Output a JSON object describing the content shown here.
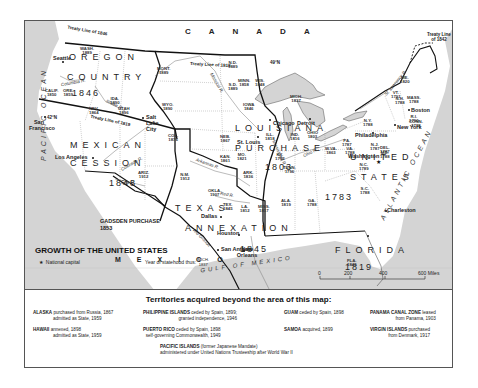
{
  "map": {
    "title": "GROWTH OF THE UNITED STATES",
    "legend": {
      "capital_symbol": "★",
      "capital_label": "National capital",
      "statehood_label": "Year of statehood thus:",
      "statehood_example_state": "MICH.",
      "statehood_example_year": "1837"
    },
    "countries": {
      "canada": "CANADA",
      "mexico": "MEXICO"
    },
    "oceans": {
      "pacific": "PACIFIC OCEAN",
      "atlantic": "ATLANTIC OCEAN",
      "gulf": "GULF OF MEXICO"
    },
    "regions": [
      {
        "name": "OREGON",
        "year": ""
      },
      {
        "name": "COUNTRY",
        "year": "1846"
      },
      {
        "name": "LOUISIANA",
        "year": ""
      },
      {
        "name": "PURCHASE",
        "year": "1803"
      },
      {
        "name": "MEXICAN",
        "year": ""
      },
      {
        "name": "CESSION",
        "year": "1848"
      },
      {
        "name": "TEXAS",
        "year": ""
      },
      {
        "name": "ANNEXATION",
        "year": "1845"
      },
      {
        "name": "UNITED",
        "year": ""
      },
      {
        "name": "STATES",
        "year": "1783"
      },
      {
        "name": "FLORIDA",
        "year": "1819"
      },
      {
        "name": "GADSDEN PURCHASE",
        "year": "1853"
      }
    ],
    "treaty_lines": [
      "Treaty Line of 1846",
      "Treaty Line of 1818",
      "Treaty Line of 1819",
      "Treaty Line of 1842",
      "Treaty 1819",
      "49°N",
      "42°N"
    ],
    "rivers": [
      "Columbia R.",
      "Snake R.",
      "Missouri R.",
      "Colorado R.",
      "Gila R.",
      "Arkansas R.",
      "Red R.",
      "Rio Grande",
      "Mississippi R.",
      "Ohio R.",
      "St. Lawrence R.",
      "Sabine R."
    ],
    "cities": [
      "Seattle",
      "San Francisco",
      "Los Angeles",
      "Salt Lake City",
      "St. Louis",
      "Chicago",
      "Detroit",
      "Philadelphia",
      "New York",
      "Boston",
      "Washington",
      "Charleston",
      "New Orleans",
      "Dallas",
      "Houston",
      "San Antonio"
    ],
    "states": [
      {
        "abbr": "WASH.",
        "year": "1889"
      },
      {
        "abbr": "ORE.",
        "year": "1859"
      },
      {
        "abbr": "IDA.",
        "year": "1890"
      },
      {
        "abbr": "MONT.",
        "year": "1889"
      },
      {
        "abbr": "WYO.",
        "year": "1890"
      },
      {
        "abbr": "N.D.",
        "year": "1889"
      },
      {
        "abbr": "S.D.",
        "year": "1889"
      },
      {
        "abbr": "NEB.",
        "year": "1867"
      },
      {
        "abbr": "KAN.",
        "year": "1861"
      },
      {
        "abbr": "MINN.",
        "year": "1858"
      },
      {
        "abbr": "IOWA",
        "year": "1846"
      },
      {
        "abbr": "MO.",
        "year": "1821"
      },
      {
        "abbr": "WIS.",
        "year": "1848"
      },
      {
        "abbr": "ILL.",
        "year": "1818"
      },
      {
        "abbr": "MICH.",
        "year": "1837"
      },
      {
        "abbr": "IND.",
        "year": "1816"
      },
      {
        "abbr": "OHIO",
        "year": "1803"
      },
      {
        "abbr": "CALIF.",
        "year": "1850"
      },
      {
        "abbr": "NEV.",
        "year": "1864"
      },
      {
        "abbr": "UTAH",
        "year": "1896"
      },
      {
        "abbr": "COL.",
        "year": "1876"
      },
      {
        "abbr": "ARIZ.",
        "year": "1912"
      },
      {
        "abbr": "N.M.",
        "year": "1912"
      },
      {
        "abbr": "OKLA.",
        "year": "1907"
      },
      {
        "abbr": "TEX.",
        "year": "1845"
      },
      {
        "abbr": "ARK.",
        "year": "1836"
      },
      {
        "abbr": "LA.",
        "year": "1812"
      },
      {
        "abbr": "MISS.",
        "year": "1817"
      },
      {
        "abbr": "ALA.",
        "year": "1819"
      },
      {
        "abbr": "GA.",
        "year": "1788"
      },
      {
        "abbr": "FLA.",
        "year": "1845"
      },
      {
        "abbr": "TENN.",
        "year": "1796"
      },
      {
        "abbr": "KY.",
        "year": "1792"
      },
      {
        "abbr": "W.VA.",
        "year": "1863"
      },
      {
        "abbr": "VA.",
        "year": "1788"
      },
      {
        "abbr": "N.C.",
        "year": "1789"
      },
      {
        "abbr": "S.C.",
        "year": "1788"
      },
      {
        "abbr": "PA.",
        "year": "1787"
      },
      {
        "abbr": "N.Y.",
        "year": "1788"
      },
      {
        "abbr": "N.J.",
        "year": "1787"
      },
      {
        "abbr": "DEL.",
        "year": "1787"
      },
      {
        "abbr": "MD.",
        "year": "1788"
      },
      {
        "abbr": "VT.",
        "year": "1791"
      },
      {
        "abbr": "N.H.",
        "year": "1788"
      },
      {
        "abbr": "ME.",
        "year": "1820"
      },
      {
        "abbr": "MASS.",
        "year": "1788"
      },
      {
        "abbr": "R.I.",
        "year": "1790"
      },
      {
        "abbr": "CONN.",
        "year": "1788"
      }
    ],
    "scale": {
      "ticks": [
        "0",
        "200",
        "400",
        "600 Miles"
      ]
    }
  },
  "footer": {
    "title": "Territories acquired beyond the area of this map:",
    "items": [
      {
        "name": "ALASKA",
        "line1": "purchased from Russia, 1867",
        "line2": "admitted as State, 1959"
      },
      {
        "name": "HAWAII",
        "line1": "annexed, 1898",
        "line2": "admitted as State, 1959"
      },
      {
        "name": "PHILIPPINE ISLANDS",
        "line1": "ceded by Spain, 1899;",
        "line2": "granted independence, 1946"
      },
      {
        "name": "PUERTO RICO",
        "line1": "ceded by Spain, 1898",
        "line2": "self-governing Commonwealth, 1949"
      },
      {
        "name": "PACIFIC ISLANDS",
        "line1": "(former Japanese Mandate)",
        "line2": "administered under United Nations Trusteeship after World War II"
      },
      {
        "name": "GUAM",
        "line1": "ceded by Spain, 1898",
        "line2": ""
      },
      {
        "name": "SAMOA",
        "line1": "acquired, 1899",
        "line2": ""
      },
      {
        "name": "PANAMA CANAL ZONE",
        "line1": "leased",
        "line2": "from Panama, 1903"
      },
      {
        "name": "VIRGIN ISLANDS",
        "line1": "purchased",
        "line2": "from Denmark, 1917"
      }
    ]
  }
}
